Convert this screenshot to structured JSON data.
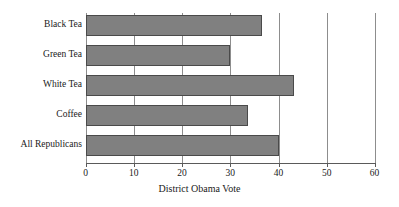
{
  "chart_data": {
    "type": "bar",
    "orientation": "horizontal",
    "title": "",
    "subtitle": "",
    "xlabel": "District Obama Vote",
    "ylabel": "",
    "categories": [
      "Black Tea",
      "Green Tea",
      "White Tea",
      "Coffee",
      "All Republicans"
    ],
    "values": [
      36.5,
      30,
      43.2,
      33.6,
      40
    ],
    "xlim": [
      0,
      60
    ],
    "xticks": [
      0,
      10,
      20,
      30,
      40,
      50,
      60
    ],
    "xtick_labels": [
      "0",
      "10",
      "20",
      "30",
      "40",
      "50",
      "60"
    ],
    "grid": "vertical-at-xticks",
    "legend": "none",
    "bar_color": "#808080",
    "bar_edge_color": "#4a4a4a",
    "grid_color": "#8d8d8d",
    "axis_color": "#5a5a5a",
    "background": "#ffffff"
  }
}
